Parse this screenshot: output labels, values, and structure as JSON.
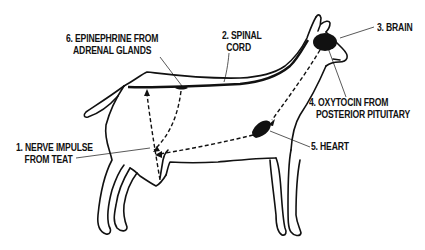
{
  "diagram": {
    "labels": {
      "nerve_impulse": {
        "number": "1.",
        "line1": "1. NERVE IMPULSE",
        "line2": "FROM TEAT"
      },
      "spinal_cord": {
        "number": "2.",
        "line1": "2. SPINAL",
        "line2": "CORD"
      },
      "brain": {
        "number": "3.",
        "line1": "3. BRAIN"
      },
      "oxytocin": {
        "number": "4.",
        "line1": "4. OXYTOCIN FROM",
        "line2": "POSTERIOR PITUITARY"
      },
      "heart": {
        "number": "5.",
        "line1": "5. HEART"
      },
      "epinephrine": {
        "number": "6.",
        "line1": "6. EPINEPHRINE FROM",
        "line2": "ADRENAL GLANDS"
      }
    },
    "caption": "",
    "colors": {
      "ink": "#111111",
      "background": "#ffffff"
    }
  }
}
